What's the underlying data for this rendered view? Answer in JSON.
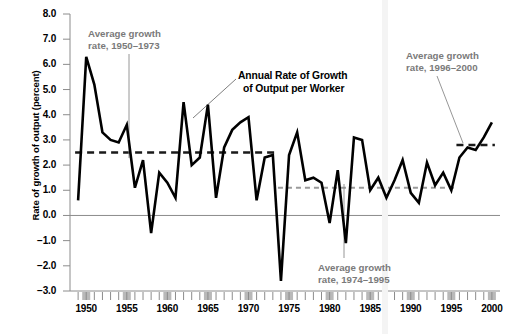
{
  "figure": {
    "title_line1": "Annual Rate of Growth",
    "title_line2": "of Output per Worker",
    "ylabel": "Rate of growth of output (percent)"
  },
  "annotations": [
    {
      "name": "annotation-1950-1973",
      "line1": "Average growth",
      "line2": "rate, 1950–1973",
      "value": 2.5
    },
    {
      "name": "annotation-1974-1995",
      "line1": "Average growth",
      "line2": "rate, 1974–1995",
      "value": 1.1
    },
    {
      "name": "annotation-1996-2000",
      "line1": "Average growth",
      "line2": "rate, 1996–2000",
      "value": 2.8
    }
  ],
  "chart_data": {
    "type": "line",
    "title": "Annual Rate of Growth of Output per Worker",
    "xlabel": "",
    "ylabel": "Rate of growth of output (percent)",
    "xlim": [
      1948,
      2001
    ],
    "ylim": [
      -3.0,
      8.0
    ],
    "grid": false,
    "legend": "none",
    "y_ticks": [
      "8.0",
      "7.0",
      "6.0",
      "5.0",
      "4.0",
      "3.0",
      "2.0",
      "1.0",
      "0.0",
      "−1.0",
      "−2.0",
      "−3.0"
    ],
    "y_tick_values": [
      8.0,
      7.0,
      6.0,
      5.0,
      4.0,
      3.0,
      2.0,
      1.0,
      0.0,
      -1.0,
      -2.0,
      -3.0
    ],
    "x_ticks": [
      "1950",
      "1955",
      "1960",
      "1965",
      "1970",
      "1975",
      "1980",
      "1985",
      "1990",
      "1995",
      "2000"
    ],
    "x_tick_values": [
      1950,
      1955,
      1960,
      1965,
      1970,
      1975,
      1980,
      1985,
      1990,
      1995,
      2000
    ],
    "x": [
      1949,
      1950,
      1951,
      1952,
      1953,
      1954,
      1955,
      1956,
      1957,
      1958,
      1959,
      1960,
      1961,
      1962,
      1963,
      1964,
      1965,
      1966,
      1967,
      1968,
      1969,
      1970,
      1971,
      1972,
      1973,
      1974,
      1975,
      1976,
      1977,
      1978,
      1979,
      1980,
      1981,
      1982,
      1983,
      1984,
      1985,
      1986,
      1987,
      1988,
      1989,
      1990,
      1991,
      1992,
      1993,
      1994,
      1995,
      1996,
      1997,
      1998,
      1999,
      2000
    ],
    "y": [
      0.6,
      6.3,
      5.2,
      3.3,
      3.0,
      2.9,
      3.6,
      1.1,
      2.2,
      -0.7,
      1.7,
      1.3,
      0.7,
      4.5,
      2.0,
      2.3,
      4.4,
      0.7,
      2.7,
      3.4,
      3.7,
      3.9,
      0.6,
      2.3,
      2.4,
      -2.6,
      2.4,
      3.3,
      1.4,
      1.5,
      1.3,
      -0.3,
      1.8,
      -1.1,
      3.1,
      3.0,
      1.0,
      1.5,
      0.7,
      1.4,
      2.2,
      0.9,
      0.5,
      2.1,
      1.2,
      1.7,
      1.0,
      2.3,
      2.7,
      2.6,
      3.1,
      3.7
    ],
    "series": [
      {
        "name": "Annual Rate of Growth of Output per Worker",
        "color": "#000000",
        "values": [
          0.6,
          6.3,
          5.2,
          3.3,
          3.0,
          2.9,
          3.6,
          1.1,
          2.2,
          -0.7,
          1.7,
          1.3,
          0.7,
          4.5,
          2.0,
          2.3,
          4.4,
          0.7,
          2.7,
          3.4,
          3.7,
          3.9,
          0.6,
          2.3,
          2.4,
          -2.6,
          2.4,
          3.3,
          1.4,
          1.5,
          1.3,
          -0.3,
          1.8,
          -1.1,
          3.1,
          3.0,
          1.0,
          1.5,
          0.7,
          1.4,
          2.2,
          0.9,
          0.5,
          2.1,
          1.2,
          1.7,
          1.0,
          2.3,
          2.7,
          2.6,
          3.1,
          3.7
        ]
      }
    ],
    "reference_lines": [
      {
        "name": "avg-1950-1973",
        "label": "Average growth rate, 1950–1973",
        "value": 2.5,
        "x_start": 1949,
        "x_end": 1973,
        "color": "#1a1a1a",
        "style": "dashed"
      },
      {
        "name": "avg-1974-1995",
        "label": "Average growth rate, 1974–1995",
        "value": 1.1,
        "x_start": 1974,
        "x_end": 1995,
        "color": "#9a9a9a",
        "style": "dashed"
      },
      {
        "name": "avg-1996-2000",
        "label": "Average growth rate, 1996–2000",
        "value": 2.8,
        "x_start": 1996,
        "x_end": 2000,
        "color": "#1a1a1a",
        "style": "dashed"
      }
    ],
    "zero_line": 0.0
  },
  "colors": {
    "line": "#000000",
    "annotation_text": "#7a7a7a",
    "axis": "#8c8c8c",
    "tick_block": "#b9b9b9",
    "background": "#ffffff"
  }
}
